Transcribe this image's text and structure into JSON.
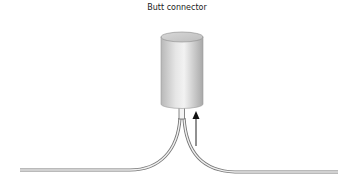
{
  "figure": {
    "title": "Butt connector",
    "components": [
      {
        "name": "connector-cylinder",
        "label": ""
      },
      {
        "name": "wire-left",
        "label": ""
      },
      {
        "name": "wire-right",
        "label": ""
      },
      {
        "name": "insertion-arrow",
        "label": ""
      }
    ]
  }
}
